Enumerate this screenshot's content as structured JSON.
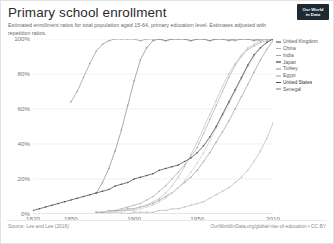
{
  "header": {
    "title": "Primary school enrollment",
    "subtitle": "Estimated enrollment ratios for total population aged 15-64, primary education level. Estimates adjusted with repetition ratios.",
    "logo_line1": "Our World",
    "logo_line2": "in Data"
  },
  "footer": {
    "source": "Source: Lee and Lee (2016)",
    "attribution": "OurWorldInData.org/global-rise-of-education • CC BY"
  },
  "legend": {
    "items": [
      {
        "label": "United Kingdom",
        "color": "#9c9c9c"
      },
      {
        "label": "China",
        "color": "#b0b0b0"
      },
      {
        "label": "India",
        "color": "#a4a4a4"
      },
      {
        "label": "Japan",
        "color": "#8e8e8e"
      },
      {
        "label": "Turkey",
        "color": "#c6c6c6"
      },
      {
        "label": "Egypt",
        "color": "#cfcfcf"
      },
      {
        "label": "United States",
        "color": "#4a4a4a"
      },
      {
        "label": "Senegal",
        "color": "#bdbdbd"
      }
    ]
  },
  "chart_data": {
    "type": "line",
    "title": "Primary school enrollment",
    "subtitle": "Estimated enrollment ratios for total population aged 15-64, primary education level. Estimates adjusted with repetition ratios.",
    "xlabel": "",
    "ylabel": "",
    "xlim": [
      1820,
      2010
    ],
    "ylim": [
      0,
      100
    ],
    "xticks": [
      1820,
      1850,
      1900,
      1950,
      2010
    ],
    "xtick_labels": [
      "1820",
      "1850",
      "1900",
      "1950",
      "2010"
    ],
    "yticks": [
      0,
      20,
      40,
      60,
      80,
      100
    ],
    "ytick_labels": [
      "0%",
      "20%",
      "40%",
      "60%",
      "80%",
      "100%"
    ],
    "grid": true,
    "legend_position": "right",
    "series": [
      {
        "name": "United Kingdom",
        "color": "#9c9c9c",
        "x": [
          1850,
          1855,
          1860,
          1865,
          1870,
          1875,
          1880,
          1885,
          1890,
          1895,
          1900,
          1905,
          1910,
          1915,
          1920,
          1925,
          1930,
          1935,
          1940,
          1945,
          1950,
          1955,
          1960,
          1965,
          1970,
          1975,
          1980,
          1985,
          1990,
          1995,
          2000,
          2005,
          2010
        ],
        "y": [
          64,
          70,
          78,
          86,
          93,
          97,
          99,
          100,
          100,
          100,
          100,
          99,
          100,
          100,
          100,
          99,
          100,
          100,
          100,
          99,
          100,
          100,
          99,
          100,
          100,
          100,
          99,
          100,
          100,
          100,
          99,
          100,
          100
        ]
      },
      {
        "name": "China",
        "color": "#b0b0b0",
        "x": [
          1870,
          1875,
          1880,
          1885,
          1890,
          1895,
          1900,
          1905,
          1910,
          1915,
          1920,
          1925,
          1930,
          1935,
          1940,
          1945,
          1950,
          1955,
          1960,
          1965,
          1970,
          1975,
          1980,
          1985,
          1990,
          1995,
          2000,
          2005,
          2010
        ],
        "y": [
          1,
          1,
          2,
          2,
          3,
          4,
          5,
          6,
          8,
          10,
          13,
          16,
          20,
          24,
          28,
          33,
          38,
          46,
          54,
          62,
          70,
          78,
          85,
          90,
          94,
          96,
          98,
          99,
          100
        ]
      },
      {
        "name": "India",
        "color": "#a4a4a4",
        "x": [
          1870,
          1875,
          1880,
          1885,
          1890,
          1895,
          1900,
          1905,
          1910,
          1915,
          1920,
          1925,
          1930,
          1935,
          1940,
          1945,
          1950,
          1955,
          1960,
          1965,
          1970,
          1975,
          1980,
          1985,
          1990,
          1995,
          2000,
          2005,
          2010
        ],
        "y": [
          1,
          1,
          1,
          2,
          2,
          3,
          3,
          4,
          5,
          6,
          8,
          10,
          12,
          15,
          18,
          21,
          25,
          30,
          35,
          41,
          47,
          53,
          60,
          67,
          74,
          81,
          88,
          94,
          99
        ]
      },
      {
        "name": "Japan",
        "color": "#8e8e8e",
        "x": [
          1870,
          1875,
          1880,
          1885,
          1890,
          1895,
          1900,
          1905,
          1910,
          1915,
          1920,
          1925,
          1930,
          1935,
          1940,
          1945,
          1950,
          1955,
          1960,
          1965,
          1970,
          1975,
          1980,
          1985,
          1990,
          1995,
          2000,
          2005,
          2010
        ],
        "y": [
          12,
          18,
          26,
          36,
          48,
          62,
          76,
          88,
          95,
          99,
          100,
          99,
          100,
          100,
          100,
          99,
          100,
          100,
          99,
          100,
          100,
          99,
          100,
          100,
          100,
          99,
          100,
          100,
          100
        ]
      },
      {
        "name": "Turkey",
        "color": "#c6c6c6",
        "x": [
          1880,
          1885,
          1890,
          1895,
          1900,
          1905,
          1910,
          1915,
          1920,
          1925,
          1930,
          1935,
          1940,
          1945,
          1950,
          1955,
          1960,
          1965,
          1970,
          1975,
          1980,
          1985,
          1990,
          1995,
          2000,
          2005,
          2010
        ],
        "y": [
          1,
          1,
          2,
          2,
          3,
          4,
          5,
          7,
          9,
          12,
          16,
          21,
          27,
          34,
          41,
          49,
          57,
          65,
          73,
          80,
          86,
          91,
          95,
          97,
          99,
          100,
          100
        ]
      },
      {
        "name": "Egypt",
        "color": "#cfcfcf",
        "x": [
          1880,
          1885,
          1890,
          1895,
          1900,
          1905,
          1910,
          1915,
          1920,
          1925,
          1930,
          1935,
          1940,
          1945,
          1950,
          1955,
          1960,
          1965,
          1970,
          1975,
          1980,
          1985,
          1990,
          1995,
          2000,
          2005,
          2010
        ],
        "y": [
          1,
          1,
          1,
          2,
          2,
          3,
          4,
          5,
          7,
          9,
          12,
          15,
          19,
          24,
          29,
          35,
          42,
          49,
          56,
          63,
          70,
          77,
          84,
          90,
          95,
          98,
          100
        ]
      },
      {
        "name": "United States",
        "color": "#4a4a4a",
        "x": [
          1820,
          1825,
          1830,
          1835,
          1840,
          1845,
          1850,
          1855,
          1860,
          1865,
          1870,
          1875,
          1880,
          1885,
          1890,
          1895,
          1900,
          1905,
          1910,
          1915,
          1920,
          1925,
          1930,
          1935,
          1940,
          1945,
          1950,
          1955,
          1960,
          1965,
          1970,
          1975,
          1980,
          1985,
          1990,
          1995,
          2000,
          2005,
          2010
        ],
        "y": [
          2,
          3,
          4,
          5,
          6,
          7,
          8,
          9,
          10,
          11,
          12,
          13,
          14,
          16,
          17,
          18,
          20,
          21,
          22,
          23,
          25,
          26,
          27,
          28,
          30,
          32,
          35,
          39,
          44,
          50,
          57,
          64,
          71,
          78,
          85,
          91,
          95,
          98,
          100
        ]
      },
      {
        "name": "Senegal",
        "color": "#bdbdbd",
        "x": [
          1890,
          1895,
          1900,
          1905,
          1910,
          1915,
          1920,
          1925,
          1930,
          1935,
          1940,
          1945,
          1950,
          1955,
          1960,
          1965,
          1970,
          1975,
          1980,
          1985,
          1990,
          1995,
          2000,
          2005,
          2010
        ],
        "y": [
          0,
          0,
          1,
          1,
          1,
          1,
          2,
          2,
          3,
          3,
          4,
          5,
          6,
          7,
          9,
          11,
          13,
          15,
          18,
          21,
          25,
          30,
          36,
          43,
          52
        ]
      }
    ]
  }
}
